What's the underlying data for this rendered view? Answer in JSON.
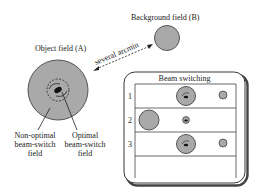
{
  "labels": {
    "object_field": "Object field (A)",
    "background_field": "Background field (B)",
    "arrow_label": "several arcmin",
    "non_optimal_line1": "Non-optimal",
    "non_optimal_line2": "beam-switch",
    "non_optimal_line3": "field",
    "optimal_line1": "Optimal",
    "optimal_line2": "beam-switch",
    "optimal_line3": "field"
  },
  "panel": {
    "title": "Beam switching",
    "rows": [
      {
        "index": "1"
      },
      {
        "index": "2"
      },
      {
        "index": "3"
      }
    ]
  },
  "colors": {
    "disk_fill": "#a9a9a9",
    "stroke": "#333333",
    "source": "#111111"
  }
}
